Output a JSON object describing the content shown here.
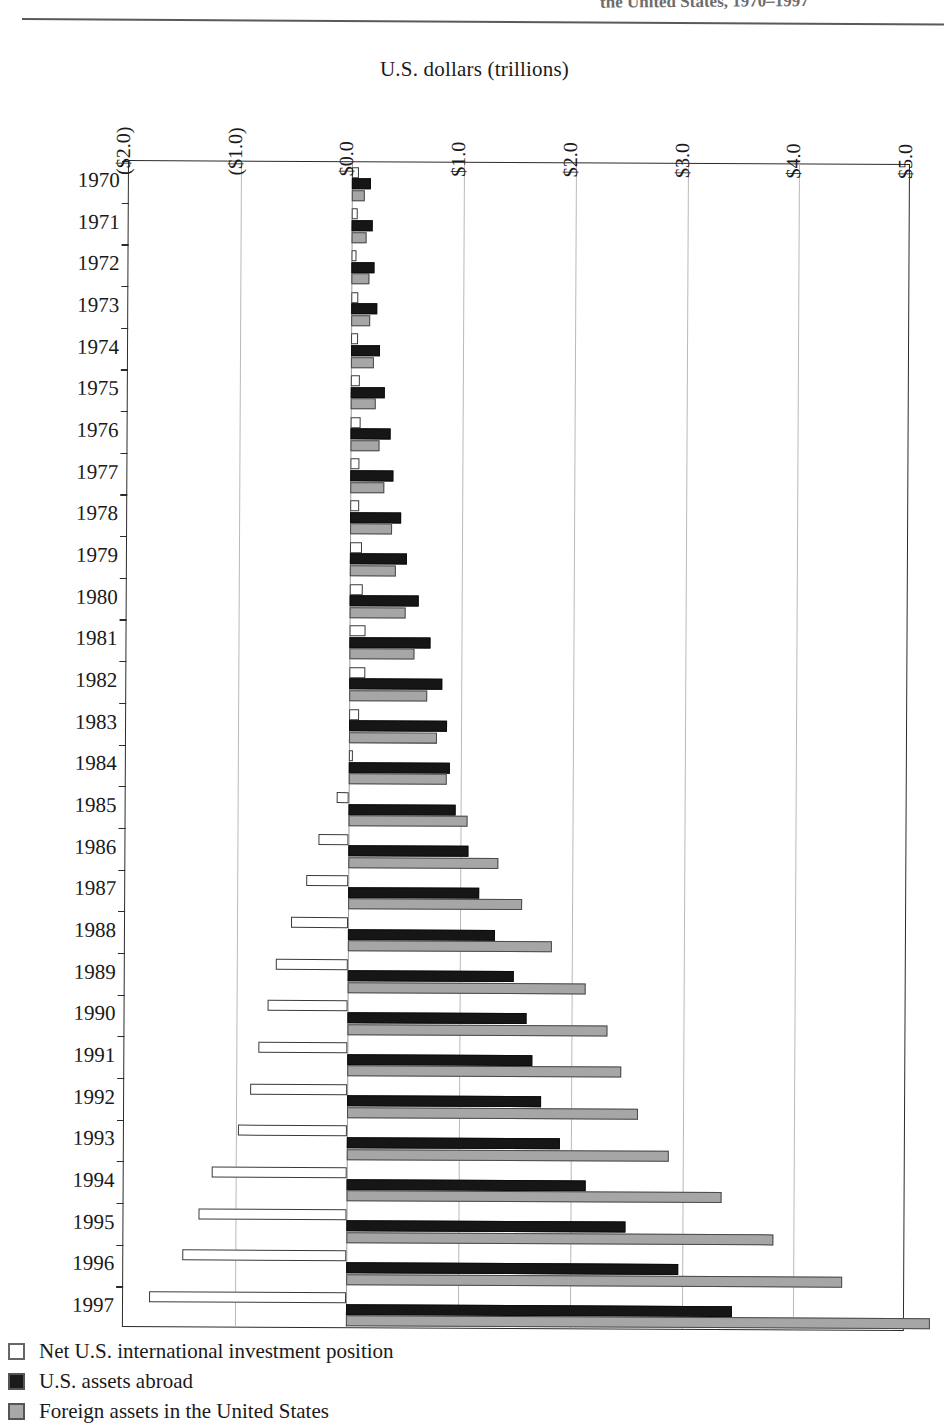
{
  "running_head": "the United States, 1970–1997",
  "axis_title": "U.S. dollars (trillions)",
  "legend": {
    "items": [
      {
        "key": "net",
        "label": "Net U.S. international investment position",
        "color": "#ffffff"
      },
      {
        "key": "assets",
        "label": "U.S. assets abroad",
        "color": "#161616"
      },
      {
        "key": "foreign",
        "label": "Foreign assets in the United States",
        "color": "#a6a6a6"
      }
    ]
  },
  "chart_data": {
    "type": "bar",
    "orientation": "horizontal",
    "title": "U.S. dollars (trillions)",
    "xlabel": "U.S. dollars (trillions)",
    "ylabel": "",
    "xlim": [
      -2.0,
      5.0
    ],
    "grid": true,
    "legend_position": "bottom-left",
    "xticks": [
      "($2.0)",
      "($1.0)",
      "$0.0",
      "$1.0",
      "$2.0",
      "$3.0",
      "$4.0",
      "$5.0"
    ],
    "xtick_values": [
      -2.0,
      -1.0,
      0.0,
      1.0,
      2.0,
      3.0,
      4.0,
      5.0
    ],
    "categories": [
      "1970",
      "1971",
      "1972",
      "1973",
      "1974",
      "1975",
      "1976",
      "1977",
      "1978",
      "1979",
      "1980",
      "1981",
      "1982",
      "1983",
      "1984",
      "1985",
      "1986",
      "1987",
      "1988",
      "1989",
      "1990",
      "1991",
      "1992",
      "1993",
      "1994",
      "1995",
      "1996",
      "1997"
    ],
    "series": [
      {
        "name": "Net U.S. international investment position",
        "color": "#ffffff",
        "values": [
          0.06,
          0.05,
          0.04,
          0.06,
          0.06,
          0.08,
          0.09,
          0.08,
          0.08,
          0.1,
          0.11,
          0.14,
          0.14,
          0.09,
          0.03,
          -0.11,
          -0.27,
          -0.38,
          -0.51,
          -0.65,
          -0.72,
          -0.8,
          -0.87,
          -0.98,
          -1.21,
          -1.33,
          -1.47,
          -1.77
        ]
      },
      {
        "name": "U.S. assets abroad",
        "color": "#161616",
        "values": [
          0.17,
          0.18,
          0.2,
          0.23,
          0.26,
          0.3,
          0.35,
          0.38,
          0.45,
          0.51,
          0.61,
          0.72,
          0.83,
          0.87,
          0.9,
          0.95,
          1.07,
          1.17,
          1.31,
          1.48,
          1.6,
          1.65,
          1.73,
          1.9,
          2.14,
          2.49,
          2.97,
          3.45
        ]
      },
      {
        "name": "Foreign assets in the United States",
        "color": "#a6a6a6",
        "values": [
          0.11,
          0.13,
          0.16,
          0.17,
          0.2,
          0.22,
          0.26,
          0.3,
          0.37,
          0.41,
          0.5,
          0.58,
          0.69,
          0.78,
          0.87,
          1.06,
          1.34,
          1.55,
          1.82,
          2.13,
          2.32,
          2.45,
          2.6,
          2.88,
          3.35,
          3.82,
          4.44,
          5.22
        ]
      }
    ]
  }
}
